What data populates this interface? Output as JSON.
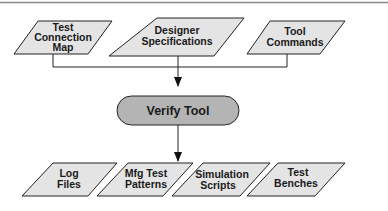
{
  "diagram": {
    "inputs": [
      {
        "id": "test-connection-map",
        "lines": [
          "Test",
          "Connection",
          "Map"
        ]
      },
      {
        "id": "designer-specifications",
        "lines": [
          "Designer",
          "Specifications"
        ]
      },
      {
        "id": "tool-commands",
        "lines": [
          "Tool",
          "Commands"
        ]
      }
    ],
    "process": {
      "id": "verify-tool",
      "label": "Verify Tool"
    },
    "outputs": [
      {
        "id": "log-files",
        "lines": [
          "Log",
          "Files"
        ]
      },
      {
        "id": "mfg-test-patterns",
        "lines": [
          "Mfg Test",
          "Patterns"
        ]
      },
      {
        "id": "simulation-scripts",
        "lines": [
          "Simulation",
          "Scripts"
        ]
      },
      {
        "id": "test-benches",
        "lines": [
          "Test",
          "Benches"
        ]
      }
    ],
    "colors": {
      "io_fill": "#e4e4e4",
      "process_fill": "#b4b4b4",
      "stroke": "#222222",
      "rule": "#8a8a8a"
    }
  }
}
